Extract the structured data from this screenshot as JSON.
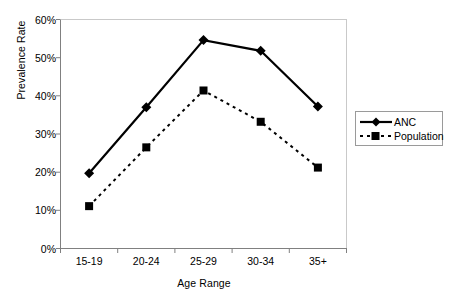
{
  "chart_data": {
    "type": "line",
    "title": "",
    "subtitle": "",
    "xlabel": "Age Range",
    "ylabel": "Prevalence Rate",
    "categories": [
      "15-19",
      "20-24",
      "25-29",
      "30-34",
      "35+"
    ],
    "ylim": [
      0,
      60
    ],
    "ytick_labels": [
      "0%",
      "10%",
      "20%",
      "30%",
      "40%",
      "50%",
      "60%"
    ],
    "ytick_values": [
      0,
      10,
      20,
      30,
      40,
      50,
      60
    ],
    "grid": false,
    "legend_position": "right",
    "series": [
      {
        "name": "ANC",
        "values": [
          19.7,
          37.0,
          54.6,
          51.8,
          37.2
        ],
        "line_style": "solid",
        "marker": "diamond",
        "color": "#000000"
      },
      {
        "name": "Population",
        "values": [
          11.1,
          26.5,
          41.4,
          33.2,
          21.2
        ],
        "line_style": "dashed",
        "marker": "square",
        "color": "#000000"
      }
    ]
  },
  "legend": {
    "entries": [
      {
        "label": "ANC"
      },
      {
        "label": "Population"
      }
    ]
  },
  "colors": {
    "series": "#000000",
    "axis": "#808080",
    "legend_border": "#9a9a9a",
    "background": "#ffffff"
  }
}
